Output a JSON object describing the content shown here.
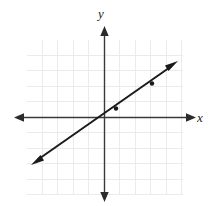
{
  "figure": {
    "kind": "cartesian-coordinate-plane",
    "background_color": "#ffffff",
    "grid_color": "#ebebeb",
    "axis_color": "#3a3a3a",
    "line_color": "#1a1a1a",
    "labels": {
      "x_axis": "x",
      "y_axis": "y"
    }
  },
  "chart_data": {
    "type": "line",
    "title": "",
    "xlabel": "x",
    "ylabel": "y",
    "grid": true,
    "legend": null,
    "xlim": [
      -5,
      5
    ],
    "ylim": [
      -5,
      5
    ],
    "x_ticks": [
      -5,
      -4,
      -3,
      -2,
      -1,
      0,
      1,
      2,
      3,
      4,
      5
    ],
    "y_ticks": [
      -5,
      -4,
      -3,
      -2,
      -1,
      0,
      1,
      2,
      3,
      4,
      5
    ],
    "tick_labels_shown": false,
    "series": [
      {
        "name": "line",
        "equation": "y = 0.7x",
        "slope": 0.7,
        "intercept": 0,
        "x": [
          -4.6,
          4.6
        ],
        "values": [
          -3.22,
          3.22
        ],
        "arrow_both_ends": true,
        "marked_points": [
          {
            "x": 0.75,
            "y": 0.52
          },
          {
            "x": 3.1,
            "y": 2.17
          }
        ]
      }
    ]
  },
  "geometry": {
    "origin_px": {
      "x": 104,
      "y": 117
    },
    "cell_px": 15.5,
    "grid_rect_px": {
      "x": 27,
      "y": 40,
      "width": 156,
      "height": 155
    },
    "x_axis_px": {
      "x1": 14,
      "y1": 117,
      "x2": 196,
      "y2": 117
    },
    "y_axis_px": {
      "x1": 104,
      "y1": 26,
      "x2": 104,
      "y2": 202
    },
    "line_px": {
      "x1": 33,
      "y1": 163,
      "x2": 176,
      "y2": 63
    },
    "dots_px": [
      {
        "x": 115,
        "y": 109
      },
      {
        "x": 152,
        "y": 83
      }
    ],
    "x_label_px": {
      "x": 201,
      "y": 121
    },
    "y_label_px": {
      "x": 101,
      "y": 17
    }
  }
}
